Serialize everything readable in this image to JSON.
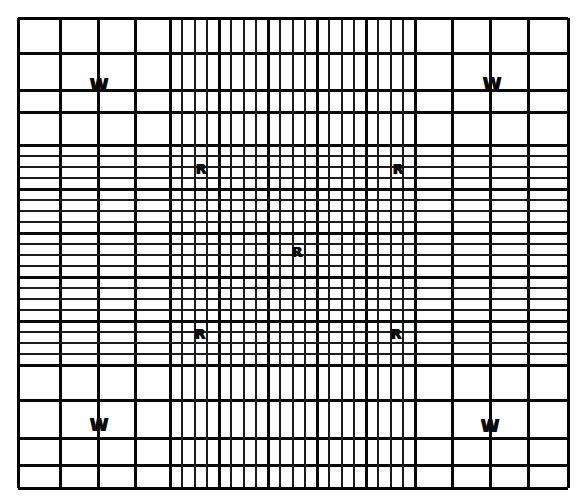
{
  "figure": {
    "name": "hemocytometer-counting-chamber-grid",
    "background_color": "#ffffff",
    "line_color": "#141414",
    "marker_color": "#0a0a0a",
    "canvas": {
      "width": 584,
      "height": 503
    }
  },
  "grid": {
    "frame": {
      "left": 18,
      "top": 18,
      "right": 568,
      "bottom": 488
    },
    "coarse_columns_left": [
      18,
      60,
      98,
      135,
      170
    ],
    "coarse_columns_right": [
      415,
      452,
      490,
      528,
      568
    ],
    "coarse_rows_top": [
      18,
      53,
      90,
      112,
      145
    ],
    "coarse_rows_bottom": [
      365,
      400,
      438,
      465,
      488
    ],
    "fine_region": {
      "left": 170,
      "right": 415,
      "top": 145,
      "bottom": 365
    },
    "fine_column_count": 20,
    "fine_row_count": 20,
    "fine_bold_every": 4
  },
  "markers": {
    "wbc_label": "W",
    "rbc_label": "R",
    "wbc_positions": [
      {
        "name": "wbc-top-left",
        "x": 99,
        "y": 85
      },
      {
        "name": "wbc-top-right",
        "x": 492,
        "y": 84
      },
      {
        "name": "wbc-bottom-left",
        "x": 99,
        "y": 425
      },
      {
        "name": "wbc-bottom-right",
        "x": 490,
        "y": 426
      }
    ],
    "rbc_positions": [
      {
        "name": "rbc-top-left",
        "x": 201,
        "y": 169
      },
      {
        "name": "rbc-top-right",
        "x": 398,
        "y": 169
      },
      {
        "name": "rbc-center",
        "x": 297,
        "y": 252
      },
      {
        "name": "rbc-bottom-left",
        "x": 200,
        "y": 334
      },
      {
        "name": "rbc-bottom-right",
        "x": 396,
        "y": 334
      }
    ]
  }
}
